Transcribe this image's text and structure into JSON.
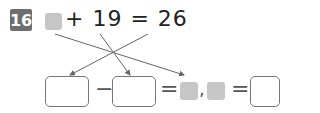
{
  "problem": {
    "number": "16",
    "equation_text": "+ 19 = 26",
    "symbols": {
      "minus": "−",
      "equals1": "=",
      "comma": ",",
      "equals2": "="
    }
  },
  "colors": {
    "badge": "#6e6e6e",
    "placeholder": "#c6c6c6",
    "arrow": "#666666"
  }
}
